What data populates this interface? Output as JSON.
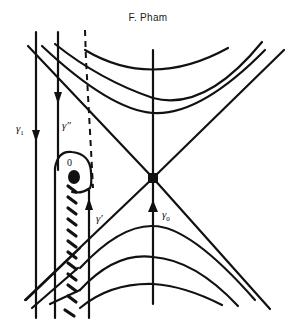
{
  "header": {
    "author": "F. Pham"
  },
  "diagram": {
    "colors": {
      "ink": "#111111",
      "background": "#ffffff"
    },
    "labels": {
      "gamma1": {
        "symbol": "γ",
        "subscript": "1"
      },
      "gamma_double_prime": {
        "symbol": "γ″"
      },
      "gamma_prime": {
        "symbol": "γ′"
      },
      "gamma0": {
        "symbol": "γ",
        "subscript": "0"
      },
      "origin": "0"
    },
    "elements": [
      "saddle-point",
      "origin-singularity",
      "branch-cut",
      "upper-hyperbolas",
      "lower-hyperbolas",
      "asymptote-lines",
      "vertical-axis",
      "path-gamma1",
      "path-gamma-double-prime",
      "path-gamma-prime",
      "path-gamma0",
      "dashed-path"
    ]
  }
}
